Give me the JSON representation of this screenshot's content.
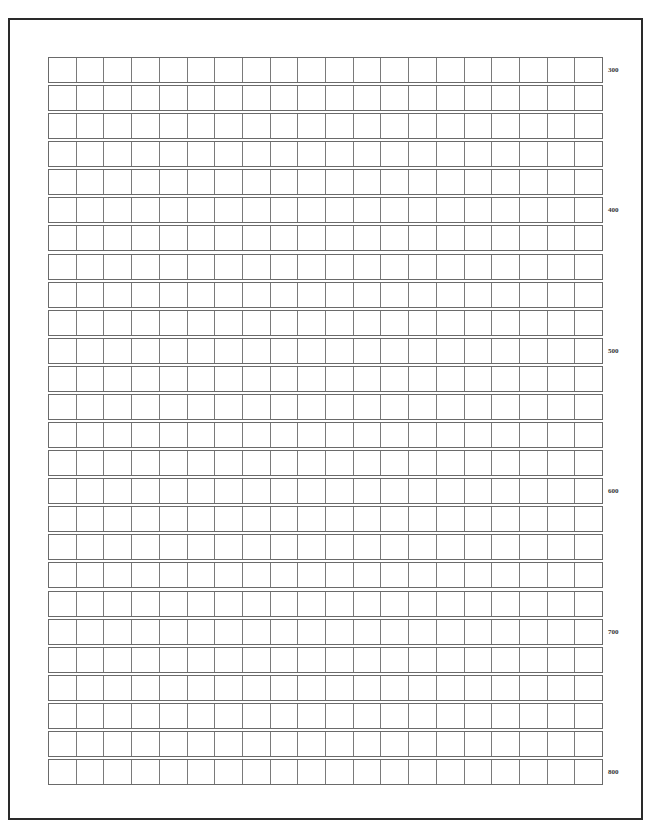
{
  "page": {
    "type": "manuscript-grid-paper",
    "rows": 26,
    "columns": 20,
    "row_pitch_px": 28.08,
    "colors": {
      "frame": "#2a2a2a",
      "grid_line": "#6a6a6a",
      "label": "#333333"
    }
  },
  "row_labels": [
    {
      "row": 1,
      "text": "300"
    },
    {
      "row": 6,
      "text": "400"
    },
    {
      "row": 11,
      "text": "500"
    },
    {
      "row": 16,
      "text": "600"
    },
    {
      "row": 21,
      "text": "700"
    },
    {
      "row": 26,
      "text": "800"
    }
  ]
}
